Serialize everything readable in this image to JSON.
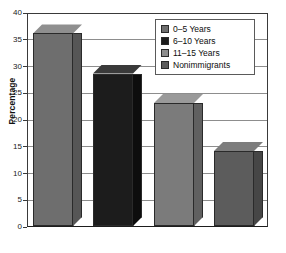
{
  "chart_data": {
    "type": "bar",
    "title": "",
    "xlabel": "",
    "ylabel": "Percentage",
    "ylim": [
      0,
      40
    ],
    "ytick_labels": [
      "40",
      "35",
      "30",
      "25",
      "20",
      "15",
      "10",
      "5",
      "0"
    ],
    "ytick_values": [
      40,
      35,
      30,
      25,
      20,
      15,
      10,
      5,
      0
    ],
    "grid": true,
    "legend_position": "top-right",
    "categories": [
      "0–5 Years",
      "6–10 Years",
      "11–15 Years",
      "Nonimmigrants"
    ],
    "values": [
      36,
      28.5,
      23,
      14
    ],
    "series": [
      {
        "name": "Percentage",
        "values": [
          36,
          28.5,
          23,
          14
        ]
      }
    ],
    "bar_colors": [
      "#6e6e6e",
      "#1c1c1c",
      "#7b7b7b",
      "#5c5c5c"
    ],
    "bar_top_colors": [
      "#8f8f8f",
      "#3a3a3a",
      "#9a9a9a",
      "#7d7d7d"
    ],
    "bar_side_colors": [
      "#565656",
      "#0d0d0d",
      "#606060",
      "#464646"
    ]
  },
  "legend": {
    "items": [
      {
        "label": "0–5 Years",
        "swatch": "#6e6e6e",
        "swatch_name": "legend-swatch-0-5-years"
      },
      {
        "label": "6–10 Years",
        "swatch": "#1c1c1c",
        "swatch_name": "legend-swatch-6-10-years"
      },
      {
        "label": "11–15 Years",
        "swatch": "#8d8d8d",
        "swatch_name": "legend-swatch-11-15-years"
      },
      {
        "label": "Nonimmigrants",
        "swatch": "#5c5c5c",
        "swatch_name": "legend-swatch-nonimmigrants"
      }
    ]
  },
  "axis": {
    "y_title": "Percentage"
  },
  "colors": {
    "gridline": "#8d8d8d",
    "axis": "#3a3a3a",
    "baseline": "#1d1d1d",
    "background": "#ffffff",
    "text": "#111111"
  }
}
